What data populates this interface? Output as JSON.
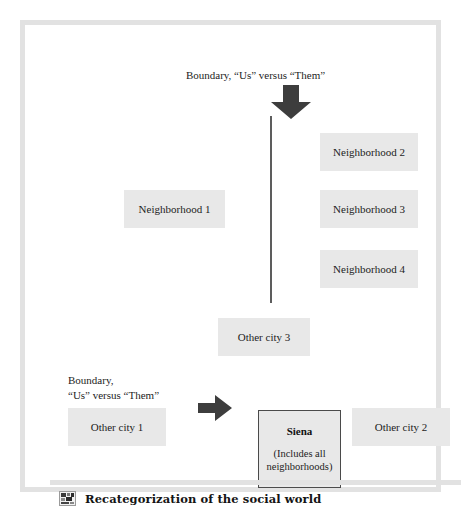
{
  "figure": {
    "caption": "Recategorization of the social world",
    "caption_icon": "thumbnail-icon",
    "frame_color": "#e2e2e2",
    "box_fill_color": "#e8e8e8",
    "arrow_color": "#3d3d3d",
    "focal_border_color": "#4a4a4a"
  },
  "diagram": {
    "type": "concept-diagram",
    "labels": {
      "top_boundary": "Boundary, “Us” versus “Them”",
      "left_boundary_line1": "Boundary,",
      "left_boundary_line2": "“Us” versus “Them”"
    },
    "boxes": [
      {
        "id": "neighborhood-1",
        "label": "Neighborhood 1"
      },
      {
        "id": "neighborhood-2",
        "label": "Neighborhood 2"
      },
      {
        "id": "neighborhood-3",
        "label": "Neighborhood 3"
      },
      {
        "id": "neighborhood-4",
        "label": "Neighborhood 4"
      },
      {
        "id": "other-city-1",
        "label": "Other city 1"
      },
      {
        "id": "other-city-2",
        "label": "Other city 2"
      },
      {
        "id": "other-city-3",
        "label": "Other city 3"
      }
    ],
    "focal_box": {
      "id": "siena",
      "title": "Siena",
      "subtitle": "(Includes all neighborhoods)"
    },
    "arrows": [
      {
        "id": "down-arrow",
        "direction": "down"
      },
      {
        "id": "right-arrow",
        "direction": "right"
      }
    ],
    "divider": {
      "id": "boundary-divider",
      "orientation": "vertical"
    }
  }
}
